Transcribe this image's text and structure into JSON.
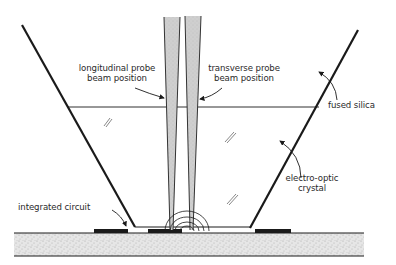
{
  "diagram": {
    "labels": {
      "longitudinal_line1": "longitudinal probe",
      "longitudinal_line2": "beam position",
      "transverse_line1": "transverse probe",
      "transverse_line2": "beam position",
      "fused_silica": "fused silica",
      "electro_optic_line1": "electro-optic",
      "electro_optic_line2": "crystal",
      "integrated_circuit": "integrated circuit"
    },
    "colors": {
      "line": "#1a1a1a",
      "beam_fill": "#c8c8c8",
      "substrate_fill": "#e2e2e2",
      "text": "#2a2a2a"
    }
  }
}
